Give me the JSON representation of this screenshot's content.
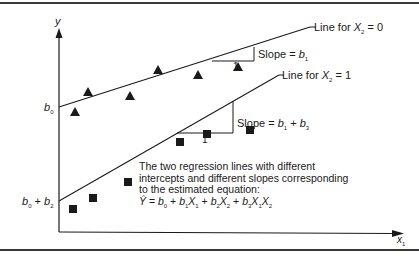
{
  "figure": {
    "axes": {
      "y_label": "y",
      "x_label": "x",
      "x_label_sub": "1"
    },
    "intercepts": {
      "upper": {
        "main": "b",
        "sub": "0"
      },
      "lower": {
        "main": "b",
        "sub": "0",
        "plus": " + ",
        "main2": "b",
        "sub2": "2"
      }
    },
    "lines": [
      {
        "label_prefix": "Line for ",
        "var": "X",
        "var_sub": "2",
        "eq": " = 0"
      },
      {
        "label_prefix": "Line for ",
        "var": "X",
        "var_sub": "2",
        "eq": " = 1"
      }
    ],
    "slopes": [
      {
        "run": "1",
        "prefix": "Slope = ",
        "b": "b",
        "b_sub": "1"
      },
      {
        "run": "1",
        "prefix": "Slope = ",
        "b": "b",
        "b_sub": "1",
        "plus": " + ",
        "b2": "b",
        "b2_sub": "3"
      }
    ],
    "note": {
      "line1": "The two regression lines with different",
      "line2": "intercepts and different slopes corresponding",
      "line3": "to the estimated equation:",
      "equation": {
        "yhat": "Ŷ",
        "eq": " = ",
        "t0": "b",
        "t0s": "0",
        "t1": "b",
        "t1s": "1",
        "x1": "X",
        "x1s": "1",
        "t2": "b",
        "t2s": "2",
        "x2": "X",
        "x2s": "2",
        "t3": "b",
        "t3s": "3",
        "x3a": "X",
        "x3as": "1",
        "x3b": "X",
        "x3bs": "2",
        "plus": " + "
      }
    },
    "markers": {
      "triangles": [
        [
          75,
          112
        ],
        [
          88,
          91
        ],
        [
          130,
          96
        ],
        [
          158,
          70
        ],
        [
          198,
          74
        ],
        [
          238,
          67
        ]
      ],
      "squares": [
        [
          73,
          209
        ],
        [
          93,
          198
        ],
        [
          128,
          182
        ],
        [
          180,
          142
        ],
        [
          207,
          134
        ],
        [
          250,
          130
        ]
      ]
    },
    "colors": {
      "ink": "#1a1a1a",
      "rule": "#3a3a3a"
    }
  }
}
